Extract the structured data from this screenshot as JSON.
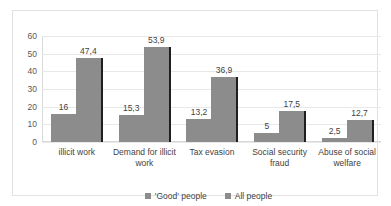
{
  "chart_data": {
    "type": "bar",
    "title": "",
    "subtitle": "",
    "xlabel": "",
    "ylabel": "",
    "ylim": [
      0,
      60
    ],
    "yticks": [
      "0",
      "10",
      "20",
      "30",
      "40",
      "50",
      "60"
    ],
    "grid": true,
    "legend_position": "bottom",
    "decimal_separator": ",",
    "categories": [
      "illicit work",
      "Demand for illicit work",
      "Tax evasion",
      "Social security fraud",
      "Abuse of social welfare"
    ],
    "series": [
      {
        "name": "'Good' people",
        "color": "#8c8c8c",
        "values": [
          16,
          15.3,
          13.2,
          5,
          2.5
        ],
        "labels": [
          "16",
          "15,3",
          "13,2",
          "5",
          "2,5"
        ]
      },
      {
        "name": "All people",
        "color": "#8c8c8c",
        "values": [
          47.4,
          53.9,
          36.9,
          17.5,
          12.7
        ],
        "labels": [
          "47,4",
          "53,9",
          "36,9",
          "17,5",
          "12,7"
        ]
      }
    ]
  }
}
